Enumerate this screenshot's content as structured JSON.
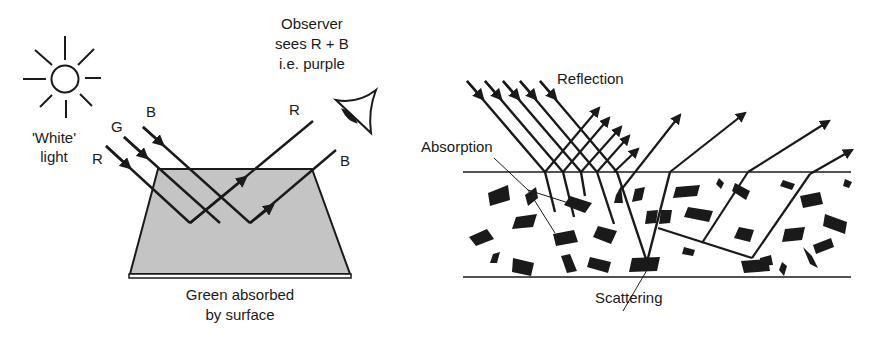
{
  "left_panel": {
    "light_source_label_line1": "'White'",
    "light_source_label_line2": "light",
    "ray_labels": {
      "red_in": "R",
      "green_in": "G",
      "blue_in": "B",
      "red_out": "R",
      "blue_out": "B"
    },
    "observer_line1": "Observer",
    "observer_line2": "sees R + B",
    "observer_line3": "i.e. purple",
    "surface_caption_line1": "Green absorbed",
    "surface_caption_line2": "by surface",
    "surface_fill": "#c4c4c4",
    "icons": [
      "sun-icon",
      "eye-icon"
    ]
  },
  "right_panel": {
    "reflection_label": "Reflection",
    "absorption_label": "Absorption",
    "scattering_label": "Scattering"
  },
  "colors": {
    "ink": "#1a1a1a",
    "surface": "#c4c4c4",
    "background": "#ffffff"
  }
}
